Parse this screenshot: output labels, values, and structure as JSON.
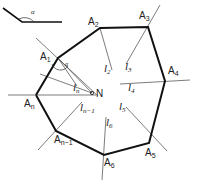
{
  "diagram": {
    "inset_angle": {
      "label": "α"
    },
    "vertices": [
      {
        "id": "A1",
        "base": "A",
        "sub": "1",
        "x": 58,
        "y": 58
      },
      {
        "id": "A2",
        "base": "A",
        "sub": "2",
        "x": 100,
        "y": 28
      },
      {
        "id": "A3",
        "base": "A",
        "sub": "3",
        "x": 148,
        "y": 27
      },
      {
        "id": "A4",
        "base": "A",
        "sub": "4",
        "x": 165,
        "y": 81
      },
      {
        "id": "A5",
        "base": "A",
        "sub": "5",
        "x": 149,
        "y": 143
      },
      {
        "id": "A6",
        "base": "A",
        "sub": "6",
        "x": 104,
        "y": 155
      },
      {
        "id": "An-1",
        "base": "A",
        "sub": "n−1",
        "x": 56,
        "y": 131
      },
      {
        "id": "An",
        "base": "A",
        "sub": "n",
        "x": 36,
        "y": 95
      }
    ],
    "lines": [
      {
        "base": "l",
        "sub": "2"
      },
      {
        "base": "l",
        "sub": "3"
      },
      {
        "base": "l",
        "sub": "4"
      },
      {
        "base": "l",
        "sub": "5"
      },
      {
        "base": "l",
        "sub": "6"
      },
      {
        "base": "l",
        "sub": "n−1"
      },
      {
        "base": "l",
        "sub": "n"
      }
    ],
    "point_N": {
      "label": "N",
      "x": 92,
      "y": 93
    },
    "angle_at_A1": "α"
  }
}
